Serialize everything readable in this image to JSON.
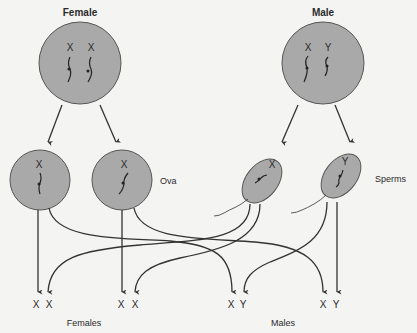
{
  "parents": {
    "female": {
      "label": "Female",
      "chromosomes": [
        "X",
        "X"
      ]
    },
    "male": {
      "label": "Male",
      "chromosomes": [
        "X",
        "Y"
      ]
    }
  },
  "gametes": {
    "ova": {
      "label": "Ova",
      "items": [
        {
          "chromosome": "X"
        },
        {
          "chromosome": "X"
        }
      ]
    },
    "sperms": {
      "label": "Sperms",
      "items": [
        {
          "chromosome": "X"
        },
        {
          "chromosome": "Y"
        }
      ]
    }
  },
  "offspring": {
    "females": {
      "label": "Females",
      "pairs": [
        [
          "X",
          "X"
        ],
        [
          "X",
          "X"
        ]
      ]
    },
    "males": {
      "label": "Males",
      "pairs": [
        [
          "X",
          "Y"
        ],
        [
          "X",
          "Y"
        ]
      ]
    }
  },
  "colors": {
    "cell_fill": "#a9a9a9",
    "line": "#333333",
    "background": "#f4f4f2"
  }
}
